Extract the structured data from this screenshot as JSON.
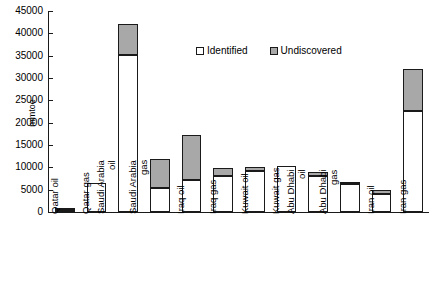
{
  "chart_data": {
    "type": "bar",
    "stacked": true,
    "title": "",
    "xlabel": "",
    "ylabel": "mmtoe",
    "ylim": [
      0,
      45000
    ],
    "ytick_step": 5000,
    "yticks": [
      0,
      5000,
      10000,
      15000,
      20000,
      25000,
      30000,
      35000,
      40000,
      45000
    ],
    "grid": false,
    "legend_position": "inside-top-center",
    "categories": [
      "Qatar oil",
      "Qatar gas",
      "Saudi Arabia oil",
      "Saudi Arabia gas",
      "Iraq oil",
      "Iraq gas",
      "Kuwait oil",
      "Kuwait gas",
      "Abu Dhabi oil",
      "Abu Dhabi gas",
      "Iran oil",
      "Iran gas"
    ],
    "series": [
      {
        "name": "Identified",
        "color": "#ffffff",
        "values": [
          400,
          6500,
          35200,
          5400,
          7200,
          8000,
          9200,
          10300,
          8000,
          6200,
          4000,
          22700
        ]
      },
      {
        "name": "Undiscovered",
        "color": "#a8a8a8",
        "values": [
          100,
          0,
          7000,
          6500,
          10100,
          1800,
          800,
          0,
          1000,
          300,
          1000,
          9300
        ]
      }
    ],
    "totals": [
      500,
      6500,
      42200,
      11900,
      17300,
      9800,
      10000,
      10300,
      9000,
      6500,
      5000,
      32000
    ]
  },
  "legend": {
    "entries": [
      {
        "label": "Identified",
        "swatch": "white-square"
      },
      {
        "label": "Undiscovered",
        "swatch": "gray-square"
      }
    ]
  },
  "axes": {
    "y_title": "mmtoe",
    "y_tick_labels": [
      "45000",
      "40000",
      "35000",
      "30000",
      "25000",
      "20000",
      "15000",
      "10000",
      "5000",
      "0"
    ]
  }
}
